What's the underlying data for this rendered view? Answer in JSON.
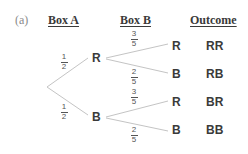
{
  "part_label": "(a)",
  "headers": {
    "box_a": "Box A",
    "box_b": "Box B",
    "outcome": "Outcome"
  },
  "tree": {
    "first_stage": [
      {
        "node": "R",
        "prob": {
          "num": "1",
          "den": "2"
        }
      },
      {
        "node": "B",
        "prob": {
          "num": "1",
          "den": "2"
        }
      }
    ],
    "second_stage": [
      {
        "parent": "R",
        "node": "R",
        "prob": {
          "num": "3",
          "den": "5"
        },
        "outcome": "RR"
      },
      {
        "parent": "R",
        "node": "B",
        "prob": {
          "num": "2",
          "den": "5"
        },
        "outcome": "RB"
      },
      {
        "parent": "B",
        "node": "R",
        "prob": {
          "num": "3",
          "den": "5"
        },
        "outcome": "BR"
      },
      {
        "parent": "B",
        "node": "B",
        "prob": {
          "num": "2",
          "den": "5"
        },
        "outcome": "BB"
      }
    ]
  },
  "colors": {
    "line": "#c4c4c4",
    "text": "#3a3a3a",
    "label": "#8a8a8a"
  }
}
